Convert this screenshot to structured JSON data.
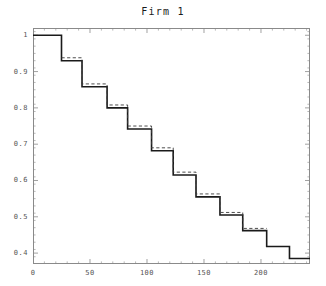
{
  "chart_data": {
    "type": "line",
    "subtype": "step-survival",
    "title": "Firm 1",
    "xlabel": "",
    "ylabel": "",
    "xlim": [
      0,
      243
    ],
    "ylim": [
      0.37,
      1.02
    ],
    "grid": false,
    "legend": null,
    "x_ticks": [
      0,
      50,
      100,
      150,
      200
    ],
    "x_tick_labels": [
      "0",
      "50",
      "100",
      "150",
      "200"
    ],
    "x_minor_tick_step": 10,
    "y_ticks": [
      0.4,
      0.5,
      0.6,
      0.7,
      0.8,
      0.9,
      1.0
    ],
    "y_tick_labels": [
      "0.4",
      "0.5",
      "0.6",
      "0.7",
      "0.8",
      "0.9",
      "1"
    ],
    "y_minor_tick_step": 0.02,
    "series": [
      {
        "name": "empirical-step",
        "style": "solid",
        "color": "#1a1a1a",
        "width": 1.6,
        "x": [
          0,
          25,
          25,
          43,
          43,
          65,
          65,
          83,
          83,
          104,
          104,
          123,
          123,
          143,
          143,
          164,
          164,
          184,
          184,
          205,
          205,
          225,
          225,
          243
        ],
        "y": [
          1.0,
          1.0,
          0.93,
          0.93,
          0.858,
          0.858,
          0.8,
          0.8,
          0.742,
          0.742,
          0.682,
          0.682,
          0.615,
          0.615,
          0.555,
          0.555,
          0.505,
          0.505,
          0.462,
          0.462,
          0.418,
          0.418,
          0.385,
          0.385
        ]
      },
      {
        "name": "fitted-dashed",
        "style": "dashed",
        "color": "#3a3a3a",
        "width": 0.9,
        "x": [
          25,
          43,
          43,
          65,
          65,
          83,
          83,
          104,
          104,
          123,
          123,
          143,
          143,
          164,
          164,
          184,
          184,
          205
        ],
        "y": [
          0.938,
          0.938,
          0.866,
          0.866,
          0.808,
          0.808,
          0.75,
          0.75,
          0.69,
          0.69,
          0.623,
          0.623,
          0.563,
          0.563,
          0.512,
          0.512,
          0.468,
          0.468
        ]
      }
    ],
    "step_drops": [
      {
        "x": 25,
        "from": 1.0,
        "to": 0.93
      },
      {
        "x": 43,
        "from": 0.93,
        "to": 0.858
      },
      {
        "x": 65,
        "from": 0.858,
        "to": 0.8
      },
      {
        "x": 83,
        "from": 0.8,
        "to": 0.742
      },
      {
        "x": 104,
        "from": 0.742,
        "to": 0.682
      },
      {
        "x": 123,
        "from": 0.682,
        "to": 0.615
      },
      {
        "x": 143,
        "from": 0.615,
        "to": 0.555
      },
      {
        "x": 164,
        "from": 0.555,
        "to": 0.505
      },
      {
        "x": 184,
        "from": 0.505,
        "to": 0.462
      },
      {
        "x": 205,
        "from": 0.462,
        "to": 0.418
      },
      {
        "x": 225,
        "from": 0.418,
        "to": 0.385
      }
    ]
  }
}
